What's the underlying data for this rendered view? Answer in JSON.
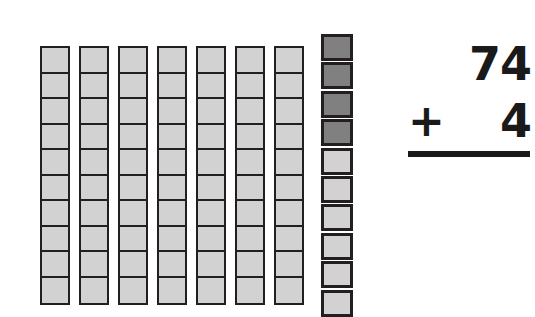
{
  "worksheet": {
    "type": "base-ten-blocks-addition",
    "colors": {
      "block_fill_light": "#d2d2d2",
      "block_fill_dark": "#808080",
      "block_outline": "#231f20",
      "ink": "#1a1a1a",
      "background": "#ffffff"
    },
    "manipulative": {
      "name": "base-ten-blocks",
      "tens_rods": {
        "count": 7,
        "units_per_rod": 10,
        "total_value": 70,
        "rod_labels": [
          "ten-rod-1",
          "ten-rod-2",
          "ten-rod-3",
          "ten-rod-4",
          "ten-rod-5",
          "ten-rod-6",
          "ten-rod-7"
        ]
      },
      "ones_column": {
        "count": 10,
        "filled_count": 4,
        "empty_count": 6,
        "cubes": [
          {
            "index": 1,
            "state": "filled"
          },
          {
            "index": 2,
            "state": "filled"
          },
          {
            "index": 3,
            "state": "filled"
          },
          {
            "index": 4,
            "state": "filled"
          },
          {
            "index": 5,
            "state": "empty"
          },
          {
            "index": 6,
            "state": "empty"
          },
          {
            "index": 7,
            "state": "empty"
          },
          {
            "index": 8,
            "state": "empty"
          },
          {
            "index": 9,
            "state": "empty"
          },
          {
            "index": 10,
            "state": "empty"
          }
        ]
      }
    },
    "equation": {
      "addend_top": "74",
      "operator": "+",
      "addend_bottom": "4",
      "sum": "",
      "rule_visible": true
    }
  }
}
